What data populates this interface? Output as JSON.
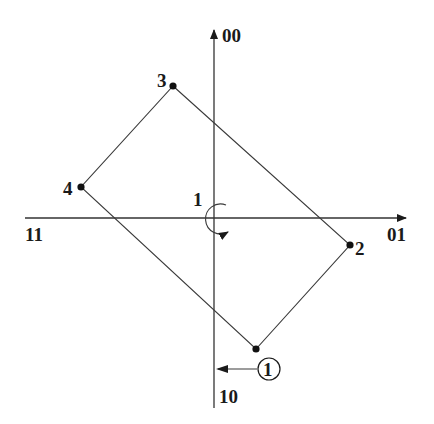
{
  "diagram": {
    "type": "constellation-path",
    "axes": {
      "top_label": "00",
      "right_label": "01",
      "left_label": "11",
      "bottom_label": "10"
    },
    "points": [
      {
        "id": "1",
        "label": "1",
        "x": 256,
        "y": 349
      },
      {
        "id": "2",
        "label": "2",
        "x": 350,
        "y": 245
      },
      {
        "id": "3",
        "label": "3",
        "x": 173,
        "y": 86
      },
      {
        "id": "4",
        "label": "4",
        "x": 81,
        "y": 187
      }
    ],
    "path_order": [
      "3",
      "2",
      "1",
      "4",
      "3"
    ],
    "rotation": {
      "label": "1",
      "direction": "clockwise"
    },
    "start_marker": {
      "label": "1",
      "circled": true
    },
    "colors": {
      "ink": "#1a1a1a",
      "background": "#ffffff"
    }
  }
}
